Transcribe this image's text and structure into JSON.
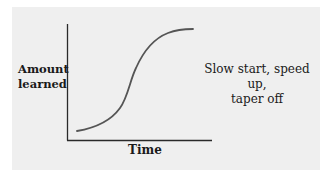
{
  "diagram": {
    "y_axis_label_line1": "Amount",
    "y_axis_label_line2": "learned",
    "x_axis_label": "Time",
    "annotation_line1": "Slow start, speed up,",
    "annotation_line2": "taper off",
    "colors": {
      "panel_background": "#efefef",
      "page_background": "#ffffff",
      "axis_color": "#2a2a2a",
      "curve_color": "#555555",
      "text_color": "#1a1a1a"
    },
    "curve_shape": "S-shaped (sigmoid) learning curve"
  }
}
